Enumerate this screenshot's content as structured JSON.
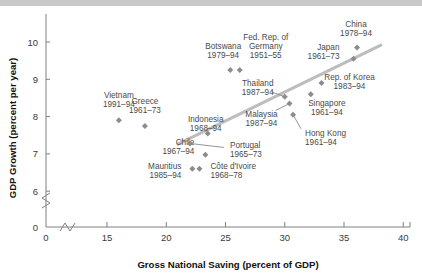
{
  "chart_data": {
    "type": "scatter",
    "title": "",
    "xlabel": "Gross National Saving (percent of GDP)",
    "ylabel": "GDP Growth (percent per year)",
    "xlim": [
      13.0,
      40.0
    ],
    "ylim": [
      5.6,
      10.6
    ],
    "xticks": [
      0,
      15,
      20,
      25,
      30,
      35,
      40
    ],
    "yticks": [
      0,
      6,
      7,
      8,
      9,
      10
    ],
    "xtick_labels": [
      "0",
      "15",
      "20",
      "25",
      "30",
      "35",
      "40"
    ],
    "ytick_labels": [
      "0",
      "6",
      "7",
      "8",
      "9",
      "10"
    ],
    "grid": false,
    "legend": "none",
    "axis_break_x": true,
    "axis_break_y": true,
    "points": [
      {
        "name": "Vietnam",
        "period": "1991–94",
        "x": 16.0,
        "y": 7.9,
        "label_pos": "above"
      },
      {
        "name": "Greece",
        "period": "1961–73",
        "x": 18.2,
        "y": 7.75,
        "label_pos": "above"
      },
      {
        "name": "Chile",
        "period": "1967–94",
        "x": 23.3,
        "y": 6.98,
        "label_pos": "left"
      },
      {
        "name": "Mauritius",
        "period": "1985–94",
        "x": 22.2,
        "y": 6.6,
        "label_pos": "left"
      },
      {
        "name": "Côte d'Ivoire",
        "period": "1968–78",
        "x": 22.8,
        "y": 6.6,
        "label_pos": "right"
      },
      {
        "name": "Portugal",
        "period": "1965–73",
        "x": 22.0,
        "y": 7.28,
        "label_pos": "leader-right"
      },
      {
        "name": "Indonesia",
        "period": "1968–94",
        "x": 23.5,
        "y": 7.55,
        "label_pos": "below"
      },
      {
        "name": "Botswana",
        "period": "1979–94",
        "x": 25.4,
        "y": 9.25,
        "label_pos": "above-left"
      },
      {
        "name": "Fed. Rep. of Germany",
        "period": "1951–55",
        "x": 26.2,
        "y": 9.25,
        "label_pos": "above-right"
      },
      {
        "name": "Thailand",
        "period": "1987–94",
        "x": 30.0,
        "y": 8.53,
        "label_pos": "leader-left"
      },
      {
        "name": "Malaysia",
        "period": "1987–94",
        "x": 30.4,
        "y": 8.35,
        "label_pos": "leader-left"
      },
      {
        "name": "Hong Kong",
        "period": "1961–94",
        "x": 30.7,
        "y": 8.05,
        "label_pos": "leader-below"
      },
      {
        "name": "Singapore",
        "period": "1961–94",
        "x": 32.2,
        "y": 8.6,
        "label_pos": "below-right"
      },
      {
        "name": "Rep. of Korea",
        "period": "1983–94",
        "x": 33.1,
        "y": 8.9,
        "label_pos": "right"
      },
      {
        "name": "Japan",
        "period": "1961–73",
        "x": 35.8,
        "y": 9.55,
        "label_pos": "left"
      },
      {
        "name": "China",
        "period": "1978–94",
        "x": 36.1,
        "y": 9.85,
        "label_pos": "above-right"
      }
    ],
    "trend_line": {
      "x1": 20.9,
      "y1": 7.25,
      "x2": 38.2,
      "y2": 9.93
    }
  },
  "colors": {
    "marker": "#8c8c8c",
    "trend": "#bdbdbd",
    "axis": "#808080",
    "label_text": "#4a4a4a",
    "axis_title_text": "#111111",
    "background": "#ffffff",
    "band": "#c9c9c9"
  }
}
